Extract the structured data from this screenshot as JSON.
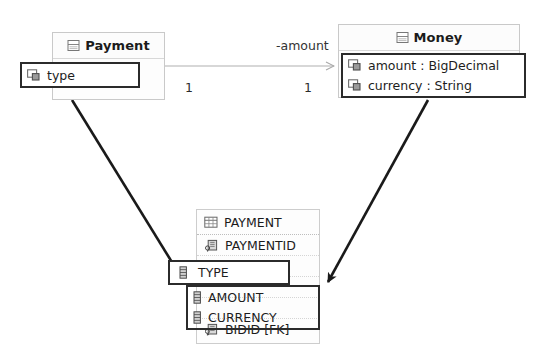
{
  "diagram": {
    "background_color": "#ffffff",
    "highlight_color": "#2b2b2b",
    "arrow_color": "#1a1a1a",
    "association_line_color": "#b0b0b0"
  },
  "payment_class": {
    "name": "Payment",
    "header_icon": "class-icon",
    "attributes": [
      {
        "label": "type",
        "icon": "attribute-icon",
        "highlighted": true
      }
    ]
  },
  "money_class": {
    "name": "Money",
    "header_icon": "class-icon",
    "attributes": [
      {
        "label": "amount : BigDecimal",
        "icon": "attribute-icon",
        "highlighted": true
      },
      {
        "label": "currency : String",
        "icon": "attribute-icon",
        "highlighted": true
      }
    ]
  },
  "association": {
    "role_label": "-amount",
    "source_multiplicity": "1",
    "target_multiplicity": "1",
    "arrow_style": "open-arrow"
  },
  "payment_table": {
    "name": "PAYMENT",
    "header_icon": "table-icon",
    "columns": [
      {
        "label": "PAYMENTID",
        "icon": "primary-key-icon",
        "highlighted": false
      },
      {
        "label": "TYPE",
        "icon": "column-icon",
        "highlighted": true
      },
      {
        "label": "AMOUNT",
        "icon": "column-icon",
        "highlighted": true
      },
      {
        "label": "CURRENCY",
        "icon": "column-icon",
        "highlighted": true
      },
      {
        "label": "BIDID [FK]",
        "icon": "foreign-key-icon",
        "highlighted": false
      }
    ]
  },
  "mappings": [
    {
      "from": "Payment.type",
      "to": "PAYMENT.TYPE"
    },
    {
      "from": "Money.amount/currency",
      "to": "PAYMENT.AMOUNT/CURRENCY"
    }
  ]
}
